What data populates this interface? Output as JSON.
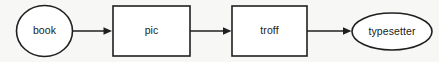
{
  "diagram": {
    "kind": "pipeline-flow-diagram",
    "canvas": {
      "width": 439,
      "height": 62,
      "background": "#f7f7f5"
    },
    "style": {
      "stroke_color": "#202020",
      "node_fill": "#ffffff",
      "text_color": "#1b1b1b",
      "stroke_width": 1.6,
      "font_size_px": 10.5
    },
    "nodes": [
      {
        "id": "book",
        "label": "book",
        "shape": "ellipse",
        "cx": 44.5,
        "cy": 31,
        "rx": 28,
        "ry": 25.5
      },
      {
        "id": "pic",
        "label": "pic",
        "shape": "rect",
        "x": 113,
        "y": 6,
        "width": 77,
        "height": 50
      },
      {
        "id": "troff",
        "label": "troff",
        "shape": "rect",
        "x": 232,
        "y": 6,
        "width": 75,
        "height": 50
      },
      {
        "id": "typesetter",
        "label": "typesetter",
        "shape": "ellipse",
        "cx": 392,
        "cy": 31.5,
        "rx": 40,
        "ry": 18.5
      }
    ],
    "edges": [
      {
        "id": "book-to-pic",
        "from": "book",
        "to": "pic",
        "label": "",
        "x1": 72.5,
        "x2": 112,
        "y": 31,
        "arrowhead": "filled-triangle"
      },
      {
        "id": "pic-to-troff",
        "from": "pic",
        "to": "troff",
        "label": "",
        "x1": 190,
        "x2": 231,
        "y": 31,
        "arrowhead": "filled-triangle"
      },
      {
        "id": "troff-to-typesetter",
        "from": "troff",
        "to": "typesetter",
        "label": "",
        "x1": 307,
        "x2": 351,
        "y": 31,
        "arrowhead": "filled-triangle"
      }
    ]
  }
}
